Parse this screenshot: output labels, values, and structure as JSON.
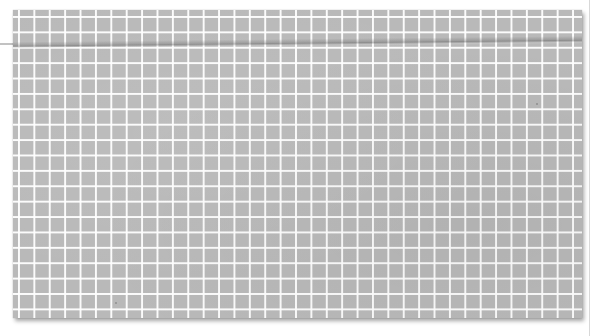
{
  "scene": {
    "description": "Photograph of a gray sheet of grid (graph) paper with white grid lines on a white background",
    "background_color": "#ffffff",
    "paper": {
      "color": "#b9b9b9",
      "grid_line_color": "#ffffff",
      "grid_cell_px": 15.4,
      "has_crease": true
    }
  }
}
